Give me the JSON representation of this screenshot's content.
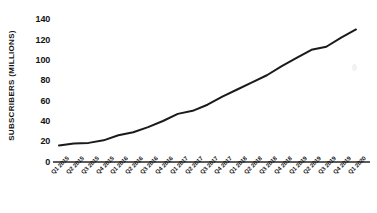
{
  "chart_data": {
    "type": "line",
    "title": "",
    "subtitle": "",
    "xlabel": "",
    "ylabel": "SUBSCRIBERS (MILLIONS)",
    "categories": [
      "Q1 2015",
      "Q2 2015",
      "Q3 2015",
      "Q4 2015",
      "Q1 2016",
      "Q2 2016",
      "Q3 2016",
      "Q4 2016",
      "Q1 2017",
      "Q2 2017",
      "Q3 2017",
      "Q4 2017",
      "Q1 2018",
      "Q2 2018",
      "Q3 2018",
      "Q4 2018",
      "Q1 2019",
      "Q2 2019",
      "Q3 2019",
      "Q4 2019",
      "Q1 2020"
    ],
    "values": [
      16,
      18,
      18.5,
      21,
      26,
      29,
      34,
      40,
      47,
      50,
      56,
      64,
      71,
      78,
      85,
      94,
      102,
      110,
      113,
      122,
      130
    ],
    "series": [
      {
        "name": "Subscribers",
        "values": [
          16,
          18,
          18.5,
          21,
          26,
          29,
          34,
          40,
          47,
          50,
          56,
          64,
          71,
          78,
          85,
          94,
          102,
          110,
          113,
          122,
          130
        ]
      }
    ],
    "ylim": [
      0,
      140
    ],
    "yticks": [
      0,
      20,
      40,
      60,
      80,
      100,
      120,
      140
    ],
    "ytick_labels": [
      "0",
      "20",
      "40",
      "60",
      "80",
      "100",
      "120",
      "140"
    ],
    "grid": false,
    "legend": false,
    "legend_position": "none",
    "line_color": "#1a1a1a",
    "line_width": 2,
    "background_color": "#ffffff",
    "axis_color": "#5b5b5b",
    "text_color": "#141414",
    "annotations": []
  },
  "axes": {
    "y_title": "SUBSCRIBERS (MILLIONS)"
  }
}
